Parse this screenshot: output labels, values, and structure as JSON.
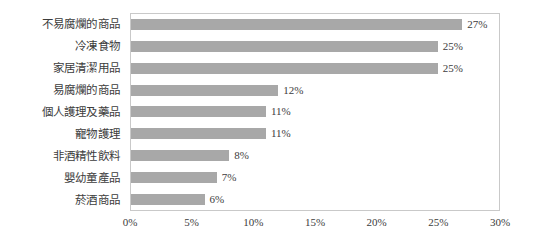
{
  "chart_data": {
    "type": "bar",
    "orientation": "horizontal",
    "title": "",
    "xlabel": "",
    "ylabel": "",
    "xlim": [
      0,
      30
    ],
    "xticks": [
      "0%",
      "5%",
      "10%",
      "15%",
      "20%",
      "25%",
      "30%"
    ],
    "xtick_values": [
      0,
      5,
      10,
      15,
      20,
      25,
      30
    ],
    "grid": false,
    "legend": "none",
    "bar_color": "#a8a8a8",
    "plot_border_color": "#c9c9c9",
    "categories": [
      "不易腐爛的商品",
      "冷凍食物",
      "家居清潔用品",
      "易腐爛的商品",
      "個人護理及藥品",
      "寵物護理",
      "非酒精性飲料",
      "嬰幼童產品",
      "菸酒商品"
    ],
    "values": [
      27,
      25,
      25,
      12,
      11,
      11,
      8,
      7,
      6
    ],
    "data_labels": [
      "27%",
      "25%",
      "25%",
      "12%",
      "11%",
      "11%",
      "8%",
      "7%",
      "6%"
    ]
  }
}
